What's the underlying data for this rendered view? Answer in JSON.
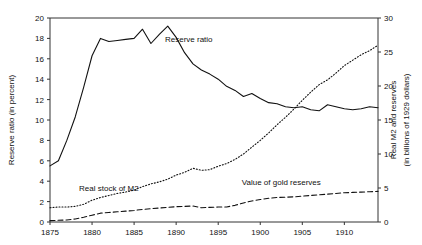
{
  "chart_data": {
    "type": "line",
    "title": "",
    "xlabel": "",
    "ylabel": "Reserve ratio (in percent)",
    "y2label_line1": "Real M2 and reserves",
    "y2label_line2": "(in billions of 1929 dollars)",
    "xlim": [
      1875,
      1914
    ],
    "ylim": [
      0,
      20
    ],
    "y2lim": [
      0,
      30
    ],
    "xticks": [
      1875,
      1880,
      1885,
      1890,
      1895,
      1900,
      1905,
      1910
    ],
    "xtick_labels": [
      "1875",
      "1880",
      "1885",
      "1890",
      "1895",
      "1900",
      "1905",
      "1910"
    ],
    "yticks": [
      0,
      2,
      4,
      6,
      8,
      10,
      12,
      14,
      16,
      18,
      20
    ],
    "ytick_labels": [
      "0",
      "2",
      "4",
      "6",
      "8",
      "10",
      "12",
      "14",
      "16",
      "18",
      "20"
    ],
    "y2ticks": [
      0,
      5,
      10,
      15,
      20,
      25,
      30
    ],
    "y2tick_labels": [
      "0",
      "5",
      "10",
      "15",
      "20",
      "25",
      "30"
    ],
    "grid": false,
    "legend_position": "inline-annotations",
    "series": [
      {
        "name": "Reserve ratio",
        "axis": "left",
        "style": "solid",
        "color": "#111111",
        "label_x": 1891.5,
        "label_y": 17.6,
        "x": [
          1875,
          1876,
          1877,
          1878,
          1879,
          1880,
          1881,
          1882,
          1883,
          1884,
          1885,
          1886,
          1887,
          1888,
          1889,
          1890,
          1891,
          1892,
          1893,
          1894,
          1895,
          1896,
          1897,
          1898,
          1899,
          1900,
          1901,
          1902,
          1903,
          1904,
          1905,
          1906,
          1907,
          1908,
          1909,
          1910,
          1911,
          1912,
          1913,
          1914
        ],
        "values": [
          5.5,
          6.0,
          8.0,
          10.3,
          13.2,
          16.3,
          18.0,
          17.7,
          17.8,
          17.9,
          18.0,
          18.9,
          17.5,
          18.4,
          19.2,
          18.1,
          16.6,
          15.5,
          14.9,
          14.5,
          14.0,
          13.3,
          12.9,
          12.3,
          12.6,
          12.1,
          11.7,
          11.6,
          11.3,
          11.2,
          11.3,
          11.0,
          10.9,
          11.5,
          11.3,
          11.1,
          11.0,
          11.1,
          11.3,
          11.2
        ]
      },
      {
        "name": "Real stock of M2",
        "axis": "right",
        "style": "dotted",
        "color": "#111111",
        "label_x": 1882.0,
        "label_y": 4.6,
        "x": [
          1875,
          1876,
          1877,
          1878,
          1879,
          1880,
          1881,
          1882,
          1883,
          1884,
          1885,
          1886,
          1887,
          1888,
          1889,
          1890,
          1891,
          1892,
          1893,
          1894,
          1895,
          1896,
          1897,
          1898,
          1899,
          1900,
          1901,
          1902,
          1903,
          1904,
          1905,
          1906,
          1907,
          1908,
          1909,
          1910,
          1911,
          1912,
          1913,
          1914
        ],
        "values": [
          2.1,
          2.2,
          2.2,
          2.3,
          2.6,
          3.2,
          3.6,
          3.9,
          4.2,
          4.4,
          4.7,
          5.2,
          5.6,
          5.9,
          6.3,
          6.9,
          7.3,
          7.9,
          7.6,
          7.7,
          8.2,
          8.6,
          9.2,
          10.0,
          11.0,
          12.0,
          13.1,
          14.3,
          15.4,
          16.6,
          17.9,
          19.1,
          20.2,
          20.9,
          21.9,
          23.0,
          23.8,
          24.6,
          25.2,
          26.0
        ]
      },
      {
        "name": "Value of gold reserves",
        "axis": "right",
        "style": "dashed",
        "color": "#111111",
        "label_x": 1902.5,
        "label_y": 5.4,
        "x": [
          1875,
          1876,
          1877,
          1878,
          1879,
          1880,
          1881,
          1882,
          1883,
          1884,
          1885,
          1886,
          1887,
          1888,
          1889,
          1890,
          1891,
          1892,
          1893,
          1894,
          1895,
          1896,
          1897,
          1898,
          1899,
          1900,
          1901,
          1902,
          1903,
          1904,
          1905,
          1906,
          1907,
          1908,
          1909,
          1910,
          1911,
          1912,
          1913,
          1914
        ],
        "values": [
          0.2,
          0.25,
          0.3,
          0.45,
          0.7,
          1.0,
          1.3,
          1.4,
          1.5,
          1.6,
          1.7,
          1.85,
          1.95,
          2.05,
          2.15,
          2.25,
          2.3,
          2.35,
          2.1,
          2.15,
          2.2,
          2.2,
          2.45,
          2.8,
          3.1,
          3.3,
          3.5,
          3.6,
          3.65,
          3.7,
          3.8,
          3.9,
          4.0,
          4.1,
          4.2,
          4.3,
          4.35,
          4.4,
          4.45,
          4.5
        ]
      }
    ]
  }
}
